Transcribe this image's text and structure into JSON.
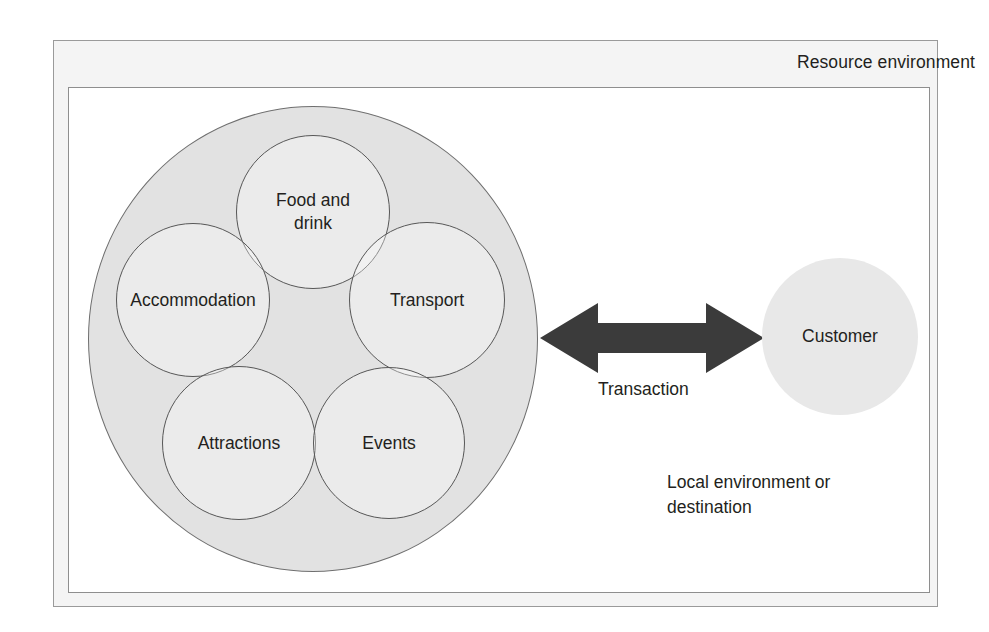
{
  "diagram": {
    "outer_frame": {
      "label": "Resource environment"
    },
    "inner_frame": {
      "label": "Local environment or\ndestination"
    },
    "supply_cluster": {
      "name": "resource-cluster",
      "circles": [
        {
          "id": "food-and-drink",
          "label": "Food and\ndrink",
          "cx": 313,
          "cy": 212,
          "r": 77
        },
        {
          "id": "accommodation",
          "label": "Accommodation",
          "cx": 193,
          "cy": 300,
          "r": 77
        },
        {
          "id": "transport",
          "label": "Transport",
          "cx": 427,
          "cy": 300,
          "r": 78
        },
        {
          "id": "attractions",
          "label": "Attractions",
          "cx": 239,
          "cy": 443,
          "r": 77
        },
        {
          "id": "events",
          "label": "Events",
          "cx": 389,
          "cy": 443,
          "r": 76
        }
      ]
    },
    "customer": {
      "label": "Customer"
    },
    "connector": {
      "label": "Transaction",
      "style": "double-headed-arrow"
    },
    "colors": {
      "outer_frame_fill": "#f4f4f4",
      "inner_frame_fill": "#ffffff",
      "frame_border": "#9a9a9a",
      "big_circle_fill": "#e2e2e2",
      "big_circle_border": "#6f6f6f",
      "sub_circle_border": "#575757",
      "customer_fill": "#e8e8e8",
      "arrow_fill": "#3b3b3b",
      "text": "#231f20"
    }
  }
}
